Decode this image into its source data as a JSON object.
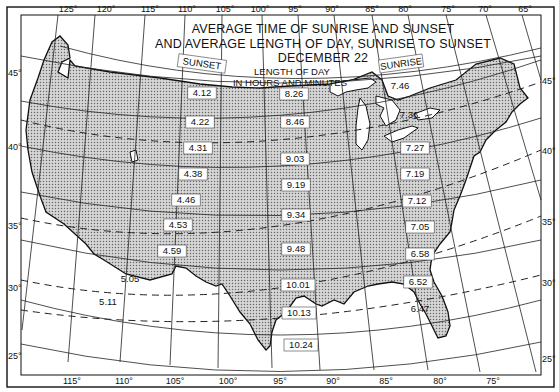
{
  "title": {
    "line1": "AVERAGE TIME OF SUNRISE AND SUNSET",
    "line2": "AND AVERAGE LENGTH OF DAY, SUNRISE TO SUNSET",
    "line3": "DECEMBER 22"
  },
  "column_headers": {
    "sunset": "SUNSET",
    "length_line1": "LENGTH OF DAY",
    "length_line2": "IN HOURS AND MINUTES",
    "sunrise": "SUNRISE"
  },
  "top_longitudes": [
    "125°",
    "120°",
    "115°",
    "110°",
    "105°",
    "100°",
    "95°",
    "90°",
    "85°",
    "80°",
    "75°",
    "70°",
    "65°"
  ],
  "bottom_longitudes": [
    "115°",
    "110°",
    "105°",
    "100°",
    "95°",
    "90°",
    "85°",
    "80°",
    "75°"
  ],
  "left_latitudes": [
    "45°",
    "40°",
    "35°",
    "30°",
    "25°"
  ],
  "right_latitudes": [
    "45°",
    "40°",
    "35°",
    "30°",
    "25°"
  ],
  "sunset_times": [
    "4.12",
    "4.22",
    "4.31",
    "4.38",
    "4.46",
    "4.53",
    "4.59",
    "5.05",
    "5.11"
  ],
  "day_lengths": [
    "8.26",
    "8.46",
    "9.03",
    "9.19",
    "9.34",
    "9.48",
    "10.01",
    "10.13",
    "10.24"
  ],
  "sunrise_times": [
    "7.46",
    "7.36",
    "7.27",
    "7.19",
    "7.12",
    "7.05",
    "6.58",
    "6.52",
    "6.47"
  ],
  "colors": {
    "ink": "#111111",
    "paper": "#ffffff",
    "land_tint": "#bdbdbd"
  }
}
